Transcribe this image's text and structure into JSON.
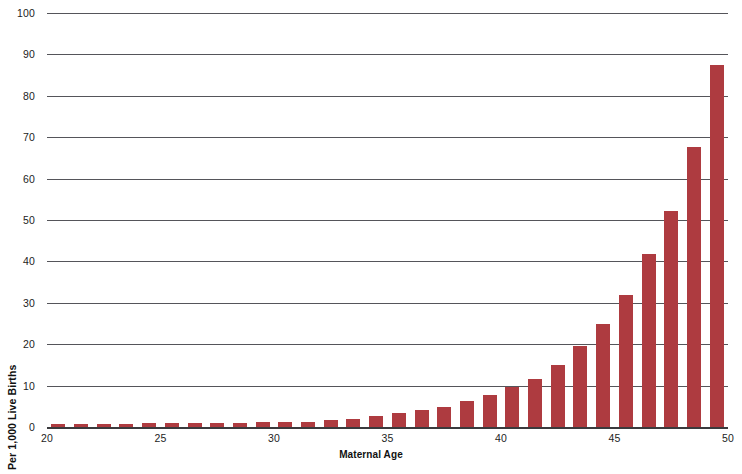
{
  "chart_data": {
    "type": "bar",
    "title": "",
    "xlabel": "Maternal Age",
    "ylabel": "Per 1,000 Live Births",
    "xlim": [
      20,
      50
    ],
    "ylim": [
      0,
      100
    ],
    "ytick_labels": [
      "0",
      "10",
      "20",
      "30",
      "40",
      "50",
      "60",
      "70",
      "80",
      "90",
      "100"
    ],
    "ytick_values": [
      0,
      10,
      20,
      30,
      40,
      50,
      60,
      70,
      80,
      90,
      100
    ],
    "xtick_labels": [
      "20",
      "25",
      "30",
      "35",
      "40",
      "45",
      "50"
    ],
    "xtick_values": [
      20,
      25,
      30,
      35,
      40,
      45,
      50
    ],
    "grid": "horizontal",
    "legend": "none",
    "bar_color": "#ae3b40",
    "categories": [
      20,
      21,
      22,
      23,
      24,
      25,
      26,
      27,
      28,
      29,
      30,
      31,
      32,
      33,
      34,
      35,
      36,
      37,
      38,
      39,
      40,
      41,
      42,
      43,
      44,
      45,
      46,
      47,
      48,
      49
    ],
    "values": [
      0.7,
      0.7,
      0.7,
      0.8,
      1.0,
      1.0,
      1.0,
      1.0,
      1.0,
      1.1,
      1.2,
      1.3,
      1.6,
      2.0,
      2.6,
      3.3,
      4.1,
      4.9,
      6.2,
      7.7,
      9.6,
      11.7,
      15.0,
      19.5,
      24.8,
      31.8,
      41.7,
      52.2,
      67.6,
      87.5
    ]
  }
}
